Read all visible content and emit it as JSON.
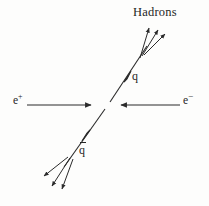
{
  "figure": {
    "background_color": "#fdfdfc",
    "stroke_color": "#2b2b2b",
    "text_color": "#252525",
    "width": 209,
    "height": 206
  },
  "labels": {
    "hadrons": "Hadrons",
    "quark": "q",
    "antiquark": "q",
    "antiquark_bar": "̅",
    "positron_base": "e",
    "positron_charge": "+",
    "electron_base": "e",
    "electron_charge": "−"
  },
  "diagram": {
    "vertex": {
      "x": 108,
      "y": 105
    },
    "beams": [
      {
        "name": "positron-beam",
        "label": "e+",
        "x1": 27,
        "y1": 105,
        "x2": 93,
        "y2": 105,
        "arrow_at": "end",
        "direction": "right"
      },
      {
        "name": "electron-beam",
        "label": "e-",
        "x1": 180,
        "y1": 105,
        "x2": 119,
        "y2": 105,
        "arrow_at": "end",
        "direction": "left"
      }
    ],
    "quark_line": {
      "name": "quark-line",
      "x1": 111,
      "y1": 101,
      "x2": 147,
      "y2": 46,
      "mid_arrow": {
        "x": 128,
        "y": 76,
        "angle_deg": -56
      }
    },
    "antiquark_line": {
      "name": "antiquark-line",
      "x1": 104,
      "y1": 110,
      "x2": 64,
      "y2": 166,
      "mid_arrow": {
        "x": 85,
        "y": 136,
        "angle_deg": 125
      }
    },
    "hadron_jet_upper": {
      "name": "upper-jet",
      "origin": {
        "x": 141,
        "y": 55
      },
      "arrows": [
        {
          "x1": 140,
          "y1": 57,
          "x2": 150,
          "y2": 25
        },
        {
          "x1": 142,
          "y1": 55,
          "x2": 159,
          "y2": 27
        },
        {
          "x1": 144,
          "y1": 54,
          "x2": 167,
          "y2": 32
        }
      ]
    },
    "hadron_jet_lower": {
      "name": "lower-jet",
      "origin": {
        "x": 69,
        "y": 158
      },
      "arrows": [
        {
          "x1": 68,
          "y1": 157,
          "x2": 42,
          "y2": 177
        },
        {
          "x1": 70,
          "y1": 158,
          "x2": 51,
          "y2": 188
        },
        {
          "x1": 73,
          "y1": 159,
          "x2": 61,
          "y2": 191
        }
      ]
    }
  }
}
